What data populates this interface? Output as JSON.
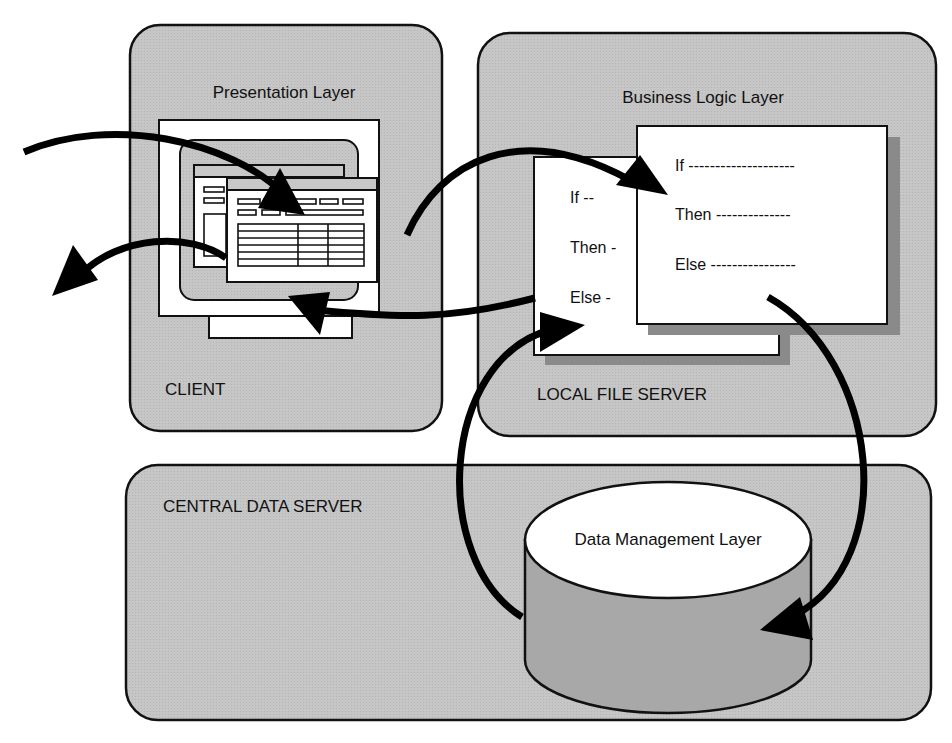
{
  "colors": {
    "panel_fill": "#c4c4c4",
    "panel_stroke": "#111111",
    "paper": "#ffffff",
    "shadow": "#8a8a8a",
    "cylinder_side": "#a8a8a8",
    "arrow": "#000000"
  },
  "client": {
    "title": "Presentation Layer",
    "label": "CLIENT"
  },
  "local_file_server": {
    "title": "Business Logic Layer",
    "label": "LOCAL FILE SERVER",
    "back_doc": {
      "lines": [
        "If --",
        "Then -",
        "Else -"
      ]
    },
    "front_doc": {
      "lines": [
        "If --------------------",
        "Then --------------",
        "Else ----------------"
      ]
    }
  },
  "central_data_server": {
    "label": "CENTRAL DATA SERVER",
    "database": {
      "label": "Data Management Layer"
    }
  }
}
